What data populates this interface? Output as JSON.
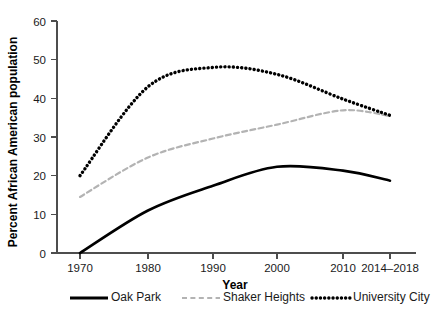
{
  "chart_data": {
    "type": "line",
    "title": "",
    "xlabel": "Year",
    "ylabel": "Percent African American population",
    "categories": [
      "1970",
      "1980",
      "1990",
      "2000",
      "2010",
      "2014–2018"
    ],
    "ylim": [
      0,
      60
    ],
    "yticks": [
      0,
      10,
      20,
      30,
      40,
      50,
      60
    ],
    "grid": false,
    "legend_position": "bottom",
    "series": [
      {
        "name": "Oak Park",
        "style": "solid",
        "color": "#000000",
        "values": [
          0,
          11,
          17.4,
          22.3,
          21.3,
          18.7
        ]
      },
      {
        "name": "Shaker Heights",
        "style": "dashed",
        "color": "#b3b3b3",
        "values": [
          14.5,
          24.7,
          29.6,
          33.2,
          36.9,
          35.4
        ]
      },
      {
        "name": "University City",
        "style": "dotted",
        "color": "#000000",
        "values": [
          20,
          43,
          48,
          46.2,
          39.8,
          35.6
        ]
      }
    ]
  },
  "axes": {
    "y_title": "Percent African American population",
    "x_title": "Year",
    "y_tick_labels": [
      "0",
      "10",
      "20",
      "30",
      "40",
      "50",
      "60"
    ],
    "x_tick_labels": [
      "1970",
      "1980",
      "1990",
      "2000",
      "2010",
      "2014–2018"
    ]
  },
  "legend": {
    "items": [
      {
        "label": "Oak Park",
        "swatch": "solid-line-swatch"
      },
      {
        "label": "Shaker Heights",
        "swatch": "dashed-line-swatch"
      },
      {
        "label": "University City",
        "swatch": "dotted-line-swatch"
      }
    ]
  }
}
